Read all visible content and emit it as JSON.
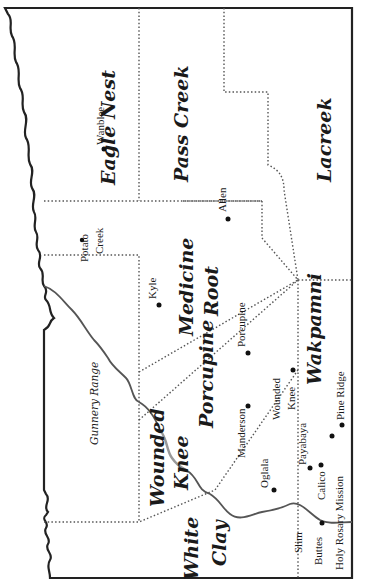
{
  "map": {
    "title": "Pine Ridge Reservation districts",
    "districts": [
      {
        "id": "eagle-nest",
        "label": "Eagle Nest"
      },
      {
        "id": "pass-creek",
        "label": "Pass Creek"
      },
      {
        "id": "lacreek",
        "label": "Lacreek"
      },
      {
        "id": "medicine-root",
        "label": "Medicine Root"
      },
      {
        "id": "wakpamni",
        "label": "Wakpamni"
      },
      {
        "id": "porcupine",
        "label": "Porcupine"
      },
      {
        "id": "wounded-knee",
        "label": "Wounded Knee"
      },
      {
        "id": "white-clay",
        "label": "White Clay"
      }
    ],
    "other_areas": [
      {
        "id": "gunnery-range",
        "label": "Gunnery Range"
      }
    ],
    "towns": [
      {
        "id": "wanblee",
        "label": "Wanblee"
      },
      {
        "id": "potato-creek",
        "label": "Potato Creek"
      },
      {
        "id": "allen",
        "label": "Allen"
      },
      {
        "id": "kyle",
        "label": "Kyle"
      },
      {
        "id": "porcupine",
        "label": "Porcupine"
      },
      {
        "id": "manderson",
        "label": "Manderson"
      },
      {
        "id": "wounded-knee",
        "label": "Wounded Knee"
      },
      {
        "id": "pine-ridge",
        "label": "Pine Ridge"
      },
      {
        "id": "payabaya",
        "label": "Payabaya"
      },
      {
        "id": "oglala",
        "label": "Oglala"
      },
      {
        "id": "calico",
        "label": "Calico"
      },
      {
        "id": "holy-rosary-mission",
        "label": "Holy Rosary Mission"
      },
      {
        "id": "slim-buttes",
        "label": "Slim Buttes"
      }
    ]
  }
}
